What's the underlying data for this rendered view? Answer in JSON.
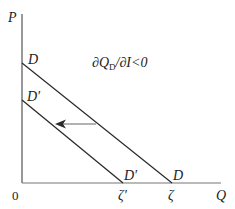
{
  "diagram": {
    "axes": {
      "y_label": "P",
      "x_label": "Q",
      "origin_label": "0"
    },
    "annotation": {
      "text_prefix": "∂Q",
      "text_sub": "D",
      "text_suffix": "/∂I<0"
    },
    "curves": [
      {
        "name": "D",
        "label_top": "D",
        "label_bottom": "D",
        "x_intercept_label": "ζ"
      },
      {
        "name": "D'",
        "label_top": "D′",
        "label_bottom": "D′",
        "x_intercept_label": "ζ′"
      }
    ],
    "shift_direction": "left",
    "colors": {
      "line": "#2a2a2a",
      "arrow": "#555555",
      "axis": "#555555"
    }
  }
}
